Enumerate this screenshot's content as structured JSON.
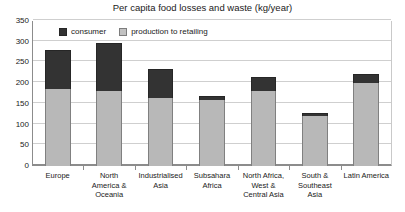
{
  "chart_data": {
    "type": "bar",
    "title": "Per capita food losses and waste (kg/year)",
    "xlabel": "",
    "ylabel": "",
    "ylim": [
      0,
      350
    ],
    "ytick_step": 50,
    "yticks": [
      0,
      50,
      100,
      150,
      200,
      250,
      300,
      350
    ],
    "grid": true,
    "stacked": true,
    "legend_position": "top-left-inside",
    "categories": [
      "Europe",
      "North America & Oceania",
      "Industrialised Asia",
      "Subsahara Africa",
      "North Africa, West & Central Asia",
      "South & Southeast Asia",
      "Latin America"
    ],
    "category_lines": [
      [
        "Europe"
      ],
      [
        "North",
        "America &",
        "Oceania"
      ],
      [
        "Industrialised",
        "Asia"
      ],
      [
        "Subsahara",
        "Africa"
      ],
      [
        "North Africa,",
        "West &",
        "Central Asia"
      ],
      [
        "South &",
        "Southeast",
        "Asia"
      ],
      [
        "Latin America"
      ]
    ],
    "series": [
      {
        "name": "production to retailing",
        "color": "#b8b8b8",
        "values": [
          185,
          180,
          165,
          160,
          180,
          120,
          200
        ]
      },
      {
        "name": "consumer",
        "color": "#333333",
        "values": [
          95,
          118,
          70,
          9,
          36,
          8,
          22
        ]
      }
    ],
    "totals": [
      280,
      298,
      235,
      169,
      216,
      128,
      222
    ]
  },
  "legend": {
    "items": [
      {
        "label": "consumer",
        "swatch": "consumer"
      },
      {
        "label": "production to retailing",
        "swatch": "production"
      }
    ]
  },
  "colors": {
    "consumer": "#333333",
    "production": "#b8b8b8",
    "grid": "#cfcfcf",
    "axis": "#8c8c8c",
    "text": "#1a1a1a",
    "background": "#ffffff"
  }
}
